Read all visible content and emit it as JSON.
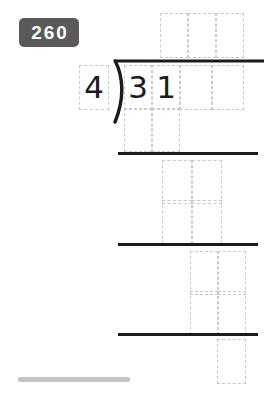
{
  "page": {
    "badge_label": "260",
    "background_color": "#ffffff"
  },
  "problem": {
    "type": "long-division",
    "divisor": "4",
    "dividend": "31",
    "dividend_digits": [
      "3",
      "1"
    ],
    "quotient": "",
    "ink_color": "#1b1b1b",
    "cell_border_color": "#c9c9c9",
    "rule_color": "#1b1b1b"
  },
  "grid": {
    "quotient_row": {
      "label": "quotient",
      "cells": [
        "",
        "",
        ""
      ]
    },
    "dividend_row": {
      "label": "dividend",
      "cells": [
        "3",
        "1",
        "",
        ""
      ]
    },
    "work_rows": [
      {
        "label": "subtract-step-1",
        "cells": [
          "",
          ""
        ]
      },
      {
        "label": "bring-down-1",
        "cells": [
          "",
          ""
        ]
      },
      {
        "label": "subtract-step-2",
        "cells": [
          "",
          ""
        ]
      },
      {
        "label": "bring-down-2",
        "cells": [
          "",
          ""
        ]
      },
      {
        "label": "subtract-step-3",
        "cells": [
          "",
          ""
        ]
      },
      {
        "label": "remainder",
        "cells": [
          ""
        ]
      }
    ]
  },
  "rules": {
    "divider_1": "work-divider-1",
    "divider_2": "work-divider-2",
    "divider_3": "work-divider-3"
  },
  "footer": {
    "progress_label": "progress-indicator",
    "progress_percent": 40
  }
}
